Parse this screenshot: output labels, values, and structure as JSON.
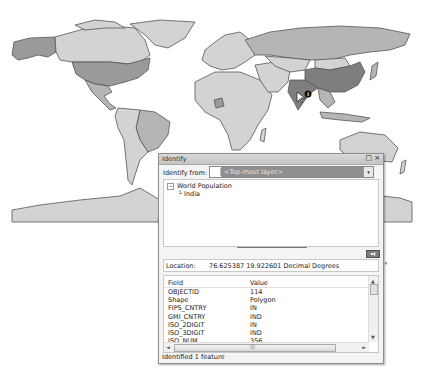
{
  "map": {
    "layer": "World Population",
    "selected_country": "India",
    "colors": {
      "ocean": "#ffffff",
      "outline": "#555555",
      "low": "#d3d3d3",
      "mid": "#b5b5b5",
      "high": "#9a9a9a",
      "highest": "#7e7e7e"
    },
    "identify_marker": "i"
  },
  "dialog": {
    "title": "Identify",
    "restore_icon": "□",
    "close_icon": "×",
    "identify_from_label": "Identify from:",
    "identify_from_value": "<Top-most layer>",
    "dropdown_arrow": "▾",
    "tree": {
      "layer": "World Population",
      "feature": "India",
      "collapse_glyph": "−",
      "branch_glyph": "└"
    },
    "view_button": "▪▮",
    "location_label": "Location:",
    "location_value": "76.625387  19.922601 Decimal Degrees",
    "location_menu": "▾",
    "table": {
      "columns": [
        "Field",
        "Value"
      ],
      "rows": [
        [
          "OBJECTID",
          "114"
        ],
        [
          "Shape",
          "Polygon"
        ],
        [
          "FIPS_CNTRY",
          "IN"
        ],
        [
          "GMI_CNTRY",
          "IND"
        ],
        [
          "ISO_2DIGIT",
          "IN"
        ],
        [
          "ISO_3DIGIT",
          "IND"
        ],
        [
          "ISO_NUM",
          "356"
        ],
        [
          "CNTRY_NAME",
          "India"
        ]
      ]
    },
    "scroll": {
      "up": "▲",
      "down": "▼",
      "left": "◄",
      "right": "►",
      "grip": "|||"
    },
    "status": "Identified 1 feature"
  }
}
